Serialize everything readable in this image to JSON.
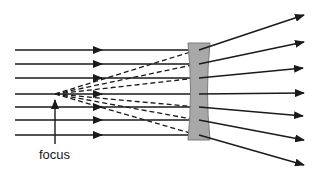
{
  "colors": {
    "ray": "#1a1a1a",
    "lens_fill": "#a8a8a8",
    "lens_stroke": "#7a7a7a",
    "background": "#ffffff"
  },
  "labels": {
    "focus": "focus"
  },
  "focus_point": {
    "x": 55,
    "y": 94
  },
  "lens": {
    "x_left": 188,
    "x_right": 210,
    "top": 43,
    "bottom": 140,
    "waist": 6
  },
  "rays": [
    {
      "y": 50,
      "end": [
        304,
        15
      ]
    },
    {
      "y": 64,
      "end": [
        304,
        42
      ]
    },
    {
      "y": 78,
      "end": [
        303,
        68
      ]
    },
    {
      "y": 94,
      "end": [
        304,
        93
      ]
    },
    {
      "y": 107,
      "end": [
        303,
        116
      ]
    },
    {
      "y": 120,
      "end": [
        304,
        140
      ]
    },
    {
      "y": 135,
      "end": [
        304,
        165
      ]
    }
  ],
  "ray_start_x": 15,
  "mid_arrow_x": 100
}
